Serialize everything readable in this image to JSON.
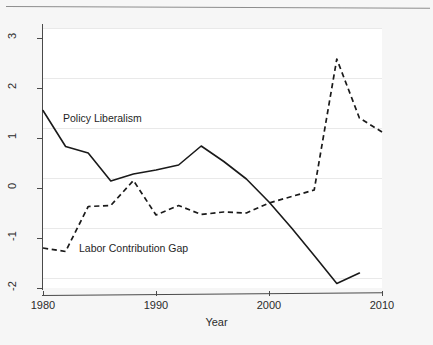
{
  "figure": {
    "background": "#f6f6f6",
    "panel_background": "#ffffff",
    "accent": "#1a1a1a",
    "gridline_color": "#e9e9e9"
  },
  "chart_data": {
    "type": "line",
    "title": "",
    "xlabel": "Year",
    "ylabel": "",
    "xlim": [
      1980,
      2010
    ],
    "ylim": [
      -2,
      3
    ],
    "xticks": [
      1980,
      1990,
      2000,
      2010
    ],
    "yticks": [
      -2,
      -1,
      0,
      1,
      2,
      3
    ],
    "xtick_labels": [
      "1980",
      "1990",
      "2000",
      "2010"
    ],
    "ytick_labels": [
      "-2",
      "-1",
      "0",
      "1",
      "2",
      "3"
    ],
    "grid": "horizontal",
    "legend_position": "inline-annotation",
    "series": [
      {
        "name": "Policy Liberalism",
        "style": "solid",
        "annotation": "Policy Liberalism",
        "x": [
          1980,
          1982,
          1984,
          1986,
          1988,
          1990,
          1992,
          1994,
          1996,
          1998,
          2000,
          2002,
          2004,
          2006,
          2008
        ],
        "values": [
          1.55,
          0.83,
          0.7,
          0.14,
          0.28,
          0.36,
          0.46,
          0.84,
          0.53,
          0.18,
          -0.28,
          -0.8,
          -1.35,
          -1.91,
          -1.7
        ]
      },
      {
        "name": "Labor Contribution Gap",
        "style": "dashed",
        "annotation": "Labor Contribution Gap",
        "x": [
          1980,
          1982,
          1984,
          1986,
          1988,
          1990,
          1992,
          1994,
          1996,
          1998,
          2000,
          2002,
          2004,
          2006,
          2008,
          2010
        ],
        "values": [
          -1.2,
          -1.27,
          -0.37,
          -0.35,
          0.15,
          -0.54,
          -0.35,
          -0.53,
          -0.48,
          -0.5,
          -0.3,
          -0.17,
          -0.04,
          2.58,
          1.4,
          1.12
        ]
      }
    ]
  },
  "annotations": {
    "policy_liberalism": "Policy Liberalism",
    "labor_contribution_gap": "Labor Contribution Gap"
  },
  "axis": {
    "x_title": "Year"
  }
}
